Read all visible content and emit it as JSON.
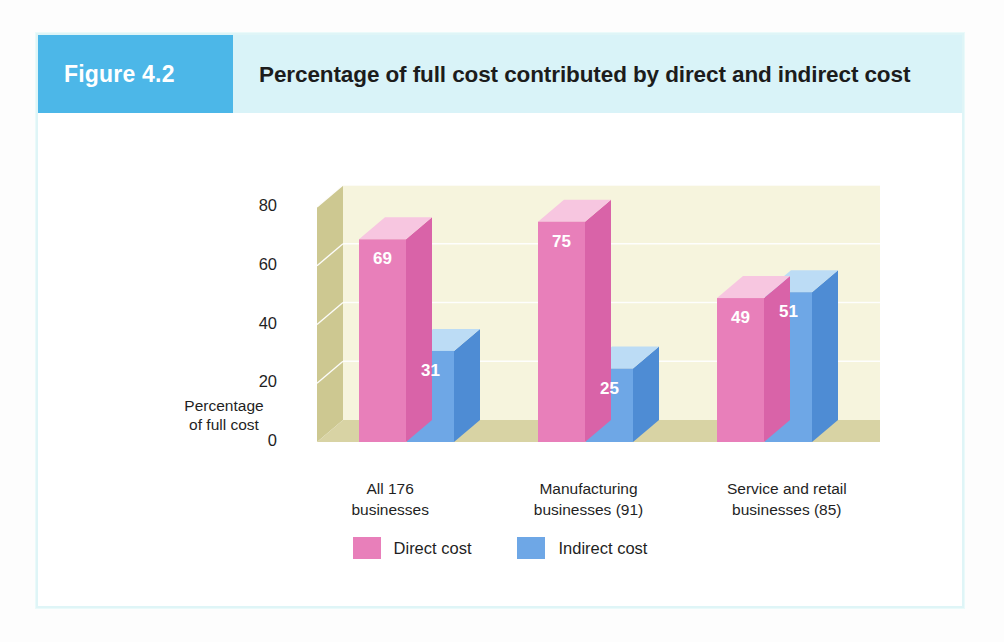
{
  "figure": {
    "badge_label": "Figure 4.2",
    "title": "Percentage of full cost contributed by direct and indirect cost",
    "badge_color": "#4cb7e8",
    "header_color": "#d9f3f8",
    "card_border_color": "#dff5f7"
  },
  "chart_data": {
    "type": "bar",
    "title": "Percentage of full cost contributed by direct and indirect cost",
    "xlabel": "",
    "ylabel": "Percentage of full cost",
    "categories": [
      "All 176 businesses",
      "Manufacturing businesses (91)",
      "Service and retail businesses (85)"
    ],
    "category_lines": [
      [
        "All 176",
        "businesses"
      ],
      [
        "Manufacturing",
        "businesses (91)"
      ],
      [
        "Service and retail",
        "businesses (85)"
      ]
    ],
    "series": [
      {
        "name": "Direct cost",
        "values": [
          69,
          75,
          49
        ],
        "color": "#e87fba"
      },
      {
        "name": "Indirect cost",
        "values": [
          31,
          25,
          51
        ],
        "color": "#6ea7e6"
      }
    ],
    "ylim": [
      0,
      80
    ],
    "yticks": [
      80,
      60,
      40,
      20,
      0
    ],
    "grid": true,
    "legend_position": "bottom",
    "three_d": true,
    "plot_colors": {
      "back_wall": "#f6f4dd",
      "left_wall": "#cdc891",
      "floor": "#d8d3a4",
      "gridline": "#ffffff",
      "direct_front": "#e87fba",
      "direct_top": "#f7c6e0",
      "direct_side": "#d963a8",
      "indirect_front": "#6ea7e6",
      "indirect_top": "#bcdcf5",
      "indirect_side": "#4e8cd4",
      "value_label": "#ffffff"
    }
  }
}
